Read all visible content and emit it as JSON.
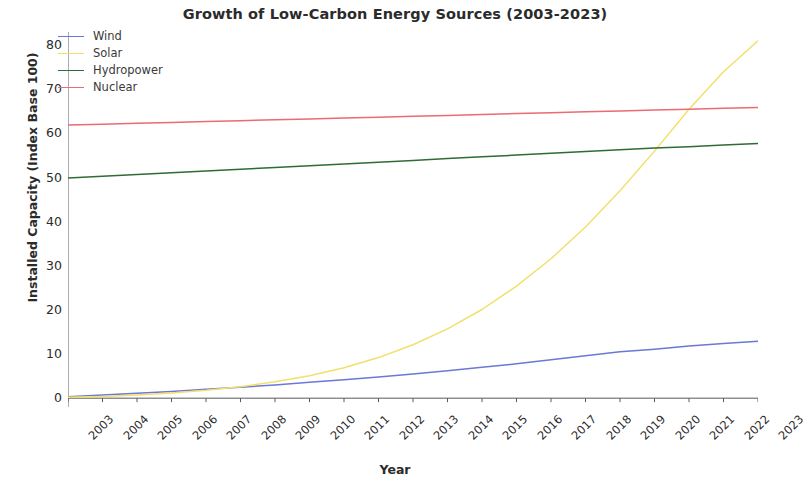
{
  "chart_data": {
    "type": "line",
    "title": "Growth of Low-Carbon Energy Sources (2003-2023)",
    "xlabel": "Year",
    "ylabel": "Installed Capacity (Index Base 100)",
    "x": [
      2003,
      2004,
      2005,
      2006,
      2007,
      2008,
      2009,
      2010,
      2011,
      2012,
      2013,
      2014,
      2015,
      2016,
      2017,
      2018,
      2019,
      2020,
      2021,
      2022,
      2023
    ],
    "categories": [
      "2003",
      "2004",
      "2005",
      "2006",
      "2007",
      "2008",
      "2009",
      "2010",
      "2011",
      "2012",
      "2013",
      "2014",
      "2015",
      "2016",
      "2017",
      "2018",
      "2019",
      "2020",
      "2021",
      "2022",
      "2023"
    ],
    "xlim": [
      2003,
      2023
    ],
    "ylim": [
      -2,
      83
    ],
    "yticks": [
      0,
      10,
      20,
      30,
      40,
      50,
      60,
      70,
      80
    ],
    "ytick_labels": [
      "0",
      "10",
      "20",
      "30",
      "40",
      "50",
      "60",
      "70",
      "80"
    ],
    "grid": false,
    "legend_position": "upper left",
    "xtick_rotation": -45,
    "series": [
      {
        "name": "Wind",
        "color": "#6b78d8",
        "values": [
          0.3,
          0.7,
          1.1,
          1.5,
          2.0,
          2.5,
          3.0,
          3.6,
          4.2,
          4.8,
          5.5,
          6.2,
          7.0,
          7.8,
          8.7,
          9.6,
          10.5,
          11.1,
          11.8,
          12.4,
          12.9
        ]
      },
      {
        "name": "Solar",
        "color": "#f2e06a",
        "values": [
          0.2,
          0.4,
          0.7,
          1.2,
          1.8,
          2.6,
          3.7,
          5.1,
          6.9,
          9.2,
          12.1,
          15.7,
          20.1,
          25.4,
          31.6,
          38.8,
          47.0,
          56.0,
          65.5,
          74.0,
          81.0
        ]
      },
      {
        "name": "Hydropower",
        "color": "#2f6b37",
        "values": [
          49.9,
          50.3,
          50.7,
          51.1,
          51.5,
          51.9,
          52.3,
          52.7,
          53.1,
          53.5,
          53.9,
          54.3,
          54.7,
          55.1,
          55.5,
          55.9,
          56.3,
          56.7,
          57.0,
          57.4,
          57.7
        ]
      },
      {
        "name": "Nuclear",
        "color": "#ec6a73",
        "values": [
          61.9,
          62.1,
          62.3,
          62.5,
          62.7,
          62.9,
          63.1,
          63.3,
          63.5,
          63.7,
          63.9,
          64.1,
          64.3,
          64.5,
          64.7,
          64.9,
          65.1,
          65.3,
          65.5,
          65.7,
          65.9
        ]
      }
    ]
  }
}
